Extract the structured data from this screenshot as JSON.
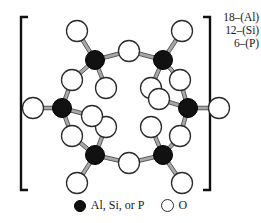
{
  "figure": {
    "bracket": {
      "left": true,
      "right": true
    },
    "composition_labels": [
      {
        "count": "18",
        "dash": "–",
        "species": "(Al)",
        "text": "18–(Al)"
      },
      {
        "count": "12",
        "dash": "–",
        "species": "(Si)",
        "text": "12–(Si)"
      },
      {
        "count": "6",
        "dash": "–",
        "species": "(P)",
        "text": "6–(P)"
      }
    ],
    "legend": {
      "filled_symbol": "filled-circle",
      "filled_label": "Al, Si, or P",
      "open_symbol": "open-circle",
      "open_label": "O"
    },
    "colors": {
      "t_site_fill": "#111111",
      "oxygen_fill": "#ffffff",
      "stroke": "#2b2b2b",
      "bracket": "#111111",
      "background": "#ffffff"
    }
  },
  "structure": {
    "type": "ring",
    "ring_size": 6,
    "t_sites": [
      {
        "id": "T1",
        "x": 95,
        "y": 60,
        "label": "Al, Si, or P"
      },
      {
        "id": "T2",
        "x": 163,
        "y": 60,
        "label": "Al, Si, or P"
      },
      {
        "id": "T3",
        "x": 188,
        "y": 108,
        "label": "Al, Si, or P"
      },
      {
        "id": "T4",
        "x": 163,
        "y": 155,
        "label": "Al, Si, or P"
      },
      {
        "id": "T5",
        "x": 95,
        "y": 155,
        "label": "Al, Si, or P"
      },
      {
        "id": "T6",
        "x": 62,
        "y": 108,
        "label": "Al, Si, or P"
      }
    ],
    "bridging_oxygens": [
      {
        "id": "Ob1",
        "x": 129,
        "y": 51,
        "between": [
          "T1",
          "T2"
        ]
      },
      {
        "id": "Ob2",
        "x": 180,
        "y": 80,
        "between": [
          "T2",
          "T3"
        ]
      },
      {
        "id": "Ob3",
        "x": 180,
        "y": 136,
        "between": [
          "T3",
          "T4"
        ]
      },
      {
        "id": "Ob4",
        "x": 129,
        "y": 163,
        "between": [
          "T4",
          "T5"
        ]
      },
      {
        "id": "Ob5",
        "x": 72,
        "y": 136,
        "between": [
          "T5",
          "T6"
        ]
      },
      {
        "id": "Ob6",
        "x": 72,
        "y": 80,
        "between": [
          "T6",
          "T1"
        ]
      }
    ],
    "terminal_oxygens": [
      {
        "id": "Ot1a",
        "x": 77,
        "y": 31,
        "on": "T1"
      },
      {
        "id": "Ot1b",
        "x": 106,
        "y": 88,
        "on": "T1"
      },
      {
        "id": "Ot2a",
        "x": 182,
        "y": 31,
        "on": "T2"
      },
      {
        "id": "Ot2b",
        "x": 151,
        "y": 88,
        "on": "T2"
      },
      {
        "id": "Ot3a",
        "x": 159,
        "y": 99,
        "on": "T3"
      },
      {
        "id": "Ot3b",
        "x": 219,
        "y": 108,
        "on": "T3"
      },
      {
        "id": "Ot4a",
        "x": 151,
        "y": 127,
        "on": "T4"
      },
      {
        "id": "Ot4b",
        "x": 182,
        "y": 183,
        "on": "T4"
      },
      {
        "id": "Ot5a",
        "x": 106,
        "y": 127,
        "on": "T5"
      },
      {
        "id": "Ot5b",
        "x": 77,
        "y": 183,
        "on": "T5"
      },
      {
        "id": "Ot6a",
        "x": 92,
        "y": 116,
        "on": "T6"
      },
      {
        "id": "Ot6b",
        "x": 33,
        "y": 108,
        "on": "T6"
      }
    ]
  }
}
